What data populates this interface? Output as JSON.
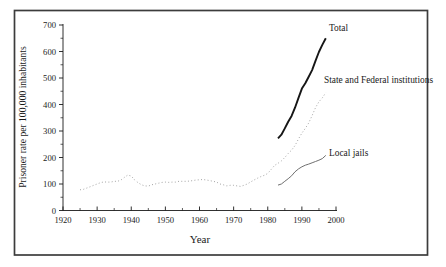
{
  "figure": {
    "background": "#ffffff",
    "frame_color": "#3c3c3c",
    "text_color": "#1a1a1a"
  },
  "chart_data": {
    "type": "line",
    "title": "",
    "xlabel": "Year",
    "ylabel": "Prisoner rate per 100,000 inhabitants",
    "xlim": [
      1920,
      2000
    ],
    "ylim": [
      0,
      700
    ],
    "x_ticks": [
      1920,
      1930,
      1940,
      1950,
      1960,
      1970,
      1980,
      1990,
      2000
    ],
    "y_ticks": [
      0,
      100,
      200,
      300,
      400,
      500,
      600,
      700
    ],
    "grid": false,
    "legend_position": "inline-annotations",
    "series": [
      {
        "name": "total",
        "label": "Total",
        "style": "solid-thick",
        "color": "#161616",
        "points": [
          [
            1983,
            272
          ],
          [
            1984,
            286
          ],
          [
            1985,
            310
          ],
          [
            1986,
            335
          ],
          [
            1987,
            357
          ],
          [
            1988,
            388
          ],
          [
            1989,
            425
          ],
          [
            1990,
            460
          ],
          [
            1991,
            480
          ],
          [
            1992,
            505
          ],
          [
            1993,
            530
          ],
          [
            1994,
            565
          ],
          [
            1995,
            598
          ],
          [
            1996,
            625
          ],
          [
            1997,
            650
          ]
        ]
      },
      {
        "name": "state-and-federal-institutions",
        "label": "State and Federal institutions",
        "style": "dotted",
        "color": "#9b9b9b",
        "points": [
          [
            1925,
            78
          ],
          [
            1926,
            80
          ],
          [
            1927,
            85
          ],
          [
            1928,
            90
          ],
          [
            1929,
            95
          ],
          [
            1930,
            100
          ],
          [
            1931,
            105
          ],
          [
            1932,
            108
          ],
          [
            1933,
            107
          ],
          [
            1934,
            107
          ],
          [
            1935,
            110
          ],
          [
            1936,
            110
          ],
          [
            1937,
            115
          ],
          [
            1938,
            125
          ],
          [
            1939,
            134
          ],
          [
            1940,
            130
          ],
          [
            1941,
            115
          ],
          [
            1942,
            105
          ],
          [
            1943,
            97
          ],
          [
            1944,
            93
          ],
          [
            1945,
            92
          ],
          [
            1946,
            97
          ],
          [
            1947,
            100
          ],
          [
            1948,
            103
          ],
          [
            1949,
            106
          ],
          [
            1950,
            107
          ],
          [
            1951,
            106
          ],
          [
            1952,
            107
          ],
          [
            1953,
            107
          ],
          [
            1954,
            110
          ],
          [
            1955,
            110
          ],
          [
            1956,
            110
          ],
          [
            1957,
            111
          ],
          [
            1958,
            113
          ],
          [
            1959,
            115
          ],
          [
            1960,
            116
          ],
          [
            1961,
            117
          ],
          [
            1962,
            115
          ],
          [
            1963,
            113
          ],
          [
            1964,
            110
          ],
          [
            1965,
            107
          ],
          [
            1966,
            100
          ],
          [
            1967,
            97
          ],
          [
            1968,
            93
          ],
          [
            1969,
            95
          ],
          [
            1970,
            95
          ],
          [
            1971,
            93
          ],
          [
            1972,
            91
          ],
          [
            1973,
            95
          ],
          [
            1974,
            100
          ],
          [
            1975,
            108
          ],
          [
            1976,
            115
          ],
          [
            1977,
            122
          ],
          [
            1978,
            128
          ],
          [
            1979,
            133
          ],
          [
            1980,
            140
          ],
          [
            1981,
            155
          ],
          [
            1982,
            170
          ],
          [
            1983,
            178
          ],
          [
            1984,
            187
          ],
          [
            1985,
            200
          ],
          [
            1986,
            215
          ],
          [
            1987,
            228
          ],
          [
            1988,
            245
          ],
          [
            1989,
            270
          ],
          [
            1990,
            292
          ],
          [
            1991,
            310
          ],
          [
            1992,
            330
          ],
          [
            1993,
            358
          ],
          [
            1994,
            388
          ],
          [
            1995,
            410
          ],
          [
            1996,
            425
          ],
          [
            1997,
            445
          ]
        ]
      },
      {
        "name": "local-jails",
        "label": "Local jails",
        "style": "solid-thin",
        "color": "#6f6f6f",
        "points": [
          [
            1983,
            96
          ],
          [
            1984,
            100
          ],
          [
            1985,
            110
          ],
          [
            1986,
            120
          ],
          [
            1987,
            131
          ],
          [
            1988,
            146
          ],
          [
            1989,
            157
          ],
          [
            1990,
            165
          ],
          [
            1991,
            171
          ],
          [
            1992,
            175
          ],
          [
            1993,
            180
          ],
          [
            1994,
            185
          ],
          [
            1995,
            190
          ],
          [
            1996,
            196
          ],
          [
            1997,
            208
          ]
        ]
      }
    ]
  }
}
